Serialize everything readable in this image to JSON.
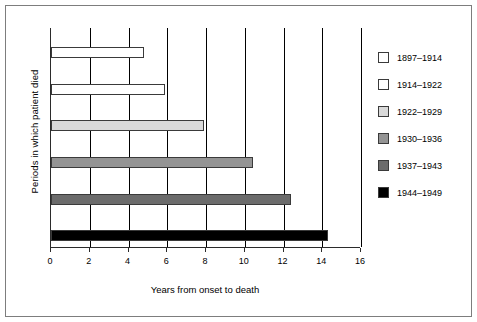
{
  "chart_data": {
    "type": "bar",
    "orientation": "horizontal",
    "title": "",
    "xlabel": "Years from onset to death",
    "ylabel": "Periods in which patient died",
    "xlim": [
      0,
      16
    ],
    "xticks": [
      0,
      2,
      4,
      6,
      8,
      10,
      12,
      14,
      16
    ],
    "grid": true,
    "grid_axis": "x",
    "legend_position": "right",
    "categories": [
      "1897–1914",
      "1914–1922",
      "1922–1929",
      "1930–1936",
      "1937–1943",
      "1944–1949"
    ],
    "values": [
      4.8,
      5.9,
      7.9,
      10.4,
      12.4,
      14.3
    ],
    "colors": [
      "#ffffff",
      "#ffffff",
      "#d9d9d9",
      "#949494",
      "#6b6b6b",
      "#000000"
    ],
    "series": [
      {
        "name": "Years from onset to death",
        "points": [
          {
            "category": "1897–1914",
            "value": 4.8,
            "color": "#ffffff"
          },
          {
            "category": "1914–1922",
            "value": 5.9,
            "color": "#ffffff"
          },
          {
            "category": "1922–1929",
            "value": 7.9,
            "color": "#d9d9d9"
          },
          {
            "category": "1930–1936",
            "value": 10.4,
            "color": "#949494"
          },
          {
            "category": "1937–1943",
            "value": 12.4,
            "color": "#6b6b6b"
          },
          {
            "category": "1944–1949",
            "value": 14.3,
            "color": "#000000"
          }
        ]
      }
    ]
  },
  "legend": {
    "items": [
      {
        "label": "1897–1914",
        "color": "#ffffff"
      },
      {
        "label": "1914–1922",
        "color": "#ffffff"
      },
      {
        "label": "1922–1929",
        "color": "#d9d9d9"
      },
      {
        "label": "1930–1936",
        "color": "#949494"
      },
      {
        "label": "1937–1943",
        "color": "#6b6b6b"
      },
      {
        "label": "1944–1949",
        "color": "#000000"
      }
    ]
  },
  "axes": {
    "x_title": "Years from onset to death",
    "y_title": "Periods in which patient died",
    "x_tick_labels": [
      "0",
      "2",
      "4",
      "6",
      "8",
      "10",
      "12",
      "14",
      "16"
    ]
  }
}
